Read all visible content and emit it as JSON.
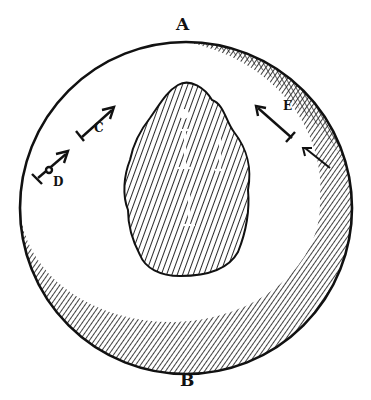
{
  "figure": {
    "type": "woodcut engraving",
    "colors": {
      "ink": "#111111",
      "paper": "#ffffff"
    }
  },
  "labels": {
    "top": "A",
    "bottom": "B",
    "needle_c": "C",
    "needle_d": "D",
    "needle_e": "E",
    "needle_f": "F",
    "inner_o": "O",
    "inner_h": "H",
    "inner_e": "E",
    "inner_l": "L"
  }
}
